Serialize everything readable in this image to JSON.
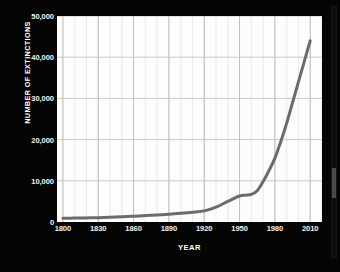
{
  "chart_data": {
    "type": "line",
    "title": "",
    "subtitle": "",
    "xlabel": "YEAR",
    "ylabel": "NUMBER OF EXTINCTIONS",
    "xlim": [
      1795,
      2020
    ],
    "ylim": [
      0,
      50000
    ],
    "grid": true,
    "grid_x_major_step": 30,
    "grid_x_minor_step": 10,
    "grid_y_step": 10000,
    "legend": null,
    "legend_position": "none",
    "line_color": "#6b6b6b",
    "background_color": "#050505",
    "plot_background_color": "#fdfdfd",
    "text_color": "#f2f2f2",
    "x_tick_labels": [
      "1800",
      "1830",
      "1860",
      "1890",
      "1920",
      "1950",
      "1980",
      "2010"
    ],
    "x_ticks": [
      1800,
      1830,
      1860,
      1890,
      1920,
      1950,
      1980,
      2010
    ],
    "y_tick_labels": [
      "0",
      "10,000",
      "20,000",
      "30,000",
      "40,000",
      "50,000"
    ],
    "y_ticks": [
      0,
      10000,
      20000,
      30000,
      40000,
      50000
    ],
    "series": [
      {
        "name": "Number of extinctions",
        "color": "#6b6b6b",
        "x": [
          1800,
          1810,
          1820,
          1830,
          1840,
          1850,
          1860,
          1870,
          1880,
          1890,
          1900,
          1910,
          1920,
          1930,
          1940,
          1950,
          1955,
          1960,
          1965,
          1970,
          1975,
          1980,
          1985,
          1990,
          1995,
          2000,
          2005,
          2010
        ],
        "values": [
          900,
          950,
          1000,
          1050,
          1150,
          1250,
          1400,
          1550,
          1700,
          1900,
          2100,
          2350,
          2700,
          3600,
          5000,
          6300,
          6500,
          6700,
          7600,
          9800,
          12500,
          15500,
          19500,
          24000,
          29000,
          34000,
          39000,
          44000
        ]
      }
    ],
    "annotations": []
  },
  "scrollbar": {
    "name": "vertical-scrollbar"
  }
}
